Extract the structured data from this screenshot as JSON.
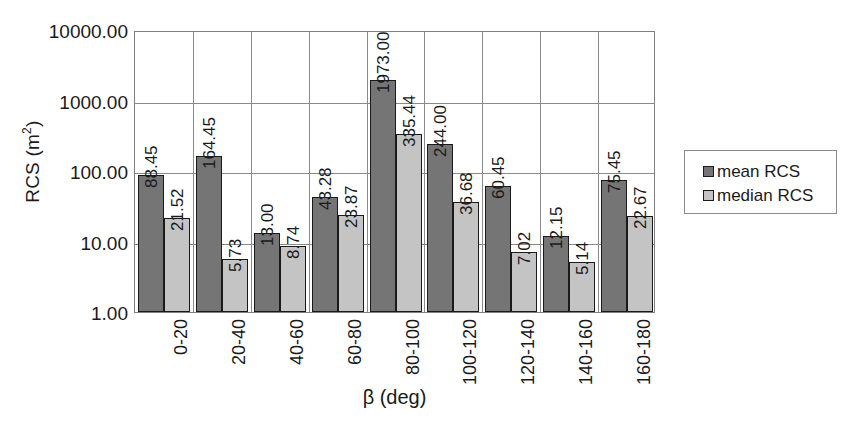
{
  "chart_data": {
    "type": "bar",
    "title": "",
    "xlabel": "β (deg)",
    "ylabel": "RCS (m²)",
    "ylabel_base": "RCS (m",
    "ylabel_sup": "2",
    "ylabel_tail": ")",
    "yscale": "log",
    "ylim": [
      1,
      10000
    ],
    "grid": true,
    "legend_position": "right",
    "categories": [
      "0-20",
      "20-40",
      "40-60",
      "60-80",
      "80-100",
      "100-120",
      "120-140",
      "140-160",
      "160-180"
    ],
    "ytick_labels": [
      "10000.00",
      "1000.00",
      "100.00",
      "10.00",
      "1.00"
    ],
    "ytick_values": [
      10000,
      1000,
      100,
      10,
      1
    ],
    "series": [
      {
        "name": "mean RCS",
        "color": "#757575",
        "values": [
          88.45,
          164.45,
          13.0,
          43.28,
          1973.0,
          244.0,
          60.45,
          12.15,
          75.45
        ],
        "labels": [
          "88.45",
          "164.45",
          "13.00",
          "43.28",
          "1973.00",
          "244.00",
          "60.45",
          "12.15",
          "75.45"
        ]
      },
      {
        "name": "median RCS",
        "color": "#c4c4c4",
        "values": [
          21.52,
          5.73,
          8.74,
          23.87,
          335.44,
          36.68,
          7.02,
          5.14,
          22.67
        ],
        "labels": [
          "21.52",
          "5.73",
          "8.74",
          "23.87",
          "335.44",
          "36.68",
          "7.02",
          "5.14",
          "22.67"
        ]
      }
    ]
  },
  "legend": {
    "items": [
      {
        "label": "mean RCS",
        "swatch": "mean"
      },
      {
        "label": "median RCS",
        "swatch": "median"
      }
    ]
  }
}
